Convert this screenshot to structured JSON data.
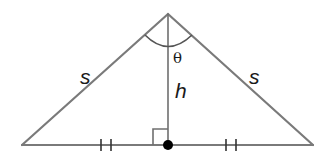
{
  "diagram": {
    "type": "isosceles-triangle",
    "labels": {
      "left_side": "s",
      "right_side": "s",
      "height": "h",
      "apex_angle": "θ"
    },
    "vertices": {
      "apex": [
        168,
        14
      ],
      "left_base": [
        22,
        145
      ],
      "right_base": [
        313,
        145
      ],
      "foot": [
        168,
        145
      ]
    },
    "marks": {
      "left_ticks": [
        101,
        111
      ],
      "right_ticks": [
        226,
        236
      ],
      "right_angle_marker": true,
      "foot_dot": true
    },
    "colors": {
      "edge": "#7a7a7a",
      "text": "#1a1a1a",
      "dot": "#000000"
    }
  }
}
